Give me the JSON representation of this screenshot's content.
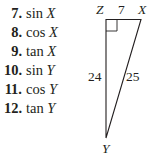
{
  "problems": [
    {
      "number": "7.",
      "func": "sin",
      "var": "X"
    },
    {
      "number": "8.",
      "func": "cos",
      "var": "X"
    },
    {
      "number": "9.",
      "func": "tan",
      "var": "X"
    },
    {
      "number": "10.",
      "func": "sin",
      "var": "Y"
    },
    {
      "number": "11.",
      "func": "cos",
      "var": "Y"
    },
    {
      "number": "12.",
      "func": "tan",
      "var": "Y"
    }
  ],
  "triangle": {
    "vertices": {
      "Z": "Z",
      "X": "X",
      "Y": "Y"
    },
    "sides": {
      "ZX": "7",
      "ZY": "24",
      "XY": "25"
    },
    "right_angle_at": "Z",
    "stroke_color": "#231f20"
  }
}
